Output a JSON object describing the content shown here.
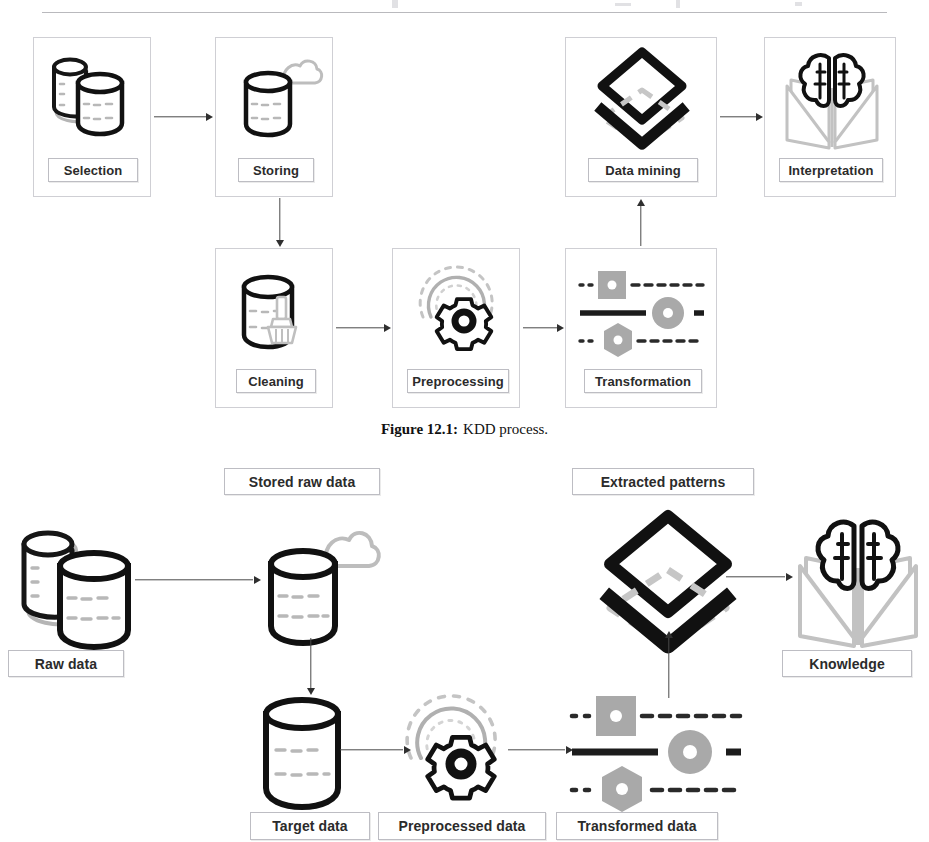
{
  "figure1": {
    "caption_label": "Figure 12.1:",
    "caption_text": "KDD process.",
    "nodes": [
      {
        "id": "selection",
        "label": "Selection",
        "icon": "database-stack-icon"
      },
      {
        "id": "storing",
        "label": "Storing",
        "icon": "database-cloud-icon"
      },
      {
        "id": "cleaning",
        "label": "Cleaning",
        "icon": "database-broom-icon"
      },
      {
        "id": "preprocessing",
        "label": "Preprocessing",
        "icon": "gear-refresh-icon"
      },
      {
        "id": "transformation",
        "label": "Transformation",
        "icon": "shapes-lines-icon"
      },
      {
        "id": "datamining",
        "label": "Data mining",
        "icon": "layers-diamond-icon"
      },
      {
        "id": "interpretation",
        "label": "Interpretation",
        "icon": "brain-book-icon"
      }
    ],
    "edges": [
      {
        "from": "selection",
        "to": "storing",
        "direction": "right"
      },
      {
        "from": "storing",
        "to": "cleaning",
        "direction": "down"
      },
      {
        "from": "cleaning",
        "to": "preprocessing",
        "direction": "right"
      },
      {
        "from": "preprocessing",
        "to": "transformation",
        "direction": "right"
      },
      {
        "from": "transformation",
        "to": "datamining",
        "direction": "up"
      },
      {
        "from": "datamining",
        "to": "interpretation",
        "direction": "right"
      }
    ]
  },
  "figure2": {
    "nodes": [
      {
        "id": "raw",
        "label": "Raw data",
        "icon": "database-stack-icon"
      },
      {
        "id": "stored",
        "label": "Stored raw data",
        "icon": "database-cloud-icon"
      },
      {
        "id": "target",
        "label": "Target data",
        "icon": "database-icon"
      },
      {
        "id": "preprocessed",
        "label": "Preprocessed data",
        "icon": "gear-refresh-icon"
      },
      {
        "id": "transformed",
        "label": "Transformed data",
        "icon": "shapes-lines-icon"
      },
      {
        "id": "patterns",
        "label": "Extracted patterns",
        "icon": "layers-diamond-icon"
      },
      {
        "id": "knowledge",
        "label": "Knowledge",
        "icon": "brain-book-icon"
      }
    ],
    "edges": [
      {
        "from": "raw",
        "to": "stored",
        "direction": "right"
      },
      {
        "from": "stored",
        "to": "target",
        "direction": "down"
      },
      {
        "from": "target",
        "to": "preprocessed",
        "direction": "right"
      },
      {
        "from": "preprocessed",
        "to": "transformed",
        "direction": "right"
      },
      {
        "from": "transformed",
        "to": "patterns",
        "direction": "up"
      },
      {
        "from": "patterns",
        "to": "knowledge",
        "direction": "right"
      }
    ]
  },
  "colors": {
    "ink": "#111111",
    "panel_border": "#cfcfd4",
    "chip_border": "#bdbdc3",
    "arrow": "#4a4a4a",
    "accent_gray": "#9a9a9a",
    "fill_gray": "#a8a8a8"
  }
}
